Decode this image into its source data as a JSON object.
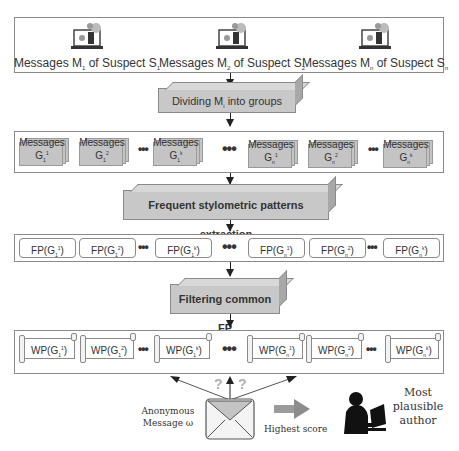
{
  "suspects": [
    {
      "prefix": "Messages M",
      "msub": "1",
      "mid": " of Suspect S",
      "ssub": "1"
    },
    {
      "prefix": "Messages M",
      "msub": "2",
      "mid": " of Suspect S",
      "ssub": "2"
    },
    {
      "prefix": "Messages M",
      "msub": "n",
      "mid": " of Suspect S",
      "ssub": "n"
    }
  ],
  "steps": {
    "divide": {
      "prefix": "Dividing M",
      "sub": "i",
      "suffix": " into groups"
    },
    "extract": "Frequent stylometric patterns extraction",
    "filter": "Filtering common FP"
  },
  "groups": [
    {
      "label": "Messages",
      "g": "G",
      "sub": "1",
      "sup": "1"
    },
    {
      "label": "Messages",
      "g": "G",
      "sub": "1",
      "sup": "2"
    },
    {
      "label": "Messages",
      "g": "G",
      "sub": "1",
      "sup": "k"
    },
    {
      "label": "Messages",
      "g": "G",
      "sub": "n",
      "sup": "1"
    },
    {
      "label": "Messages",
      "g": "G",
      "sub": "n",
      "sup": "2"
    },
    {
      "label": "Messages",
      "g": "G",
      "sub": "n",
      "sup": "k"
    }
  ],
  "fps": [
    {
      "pre": "FP(G",
      "sub": "1",
      "sup": "1",
      "post": ")"
    },
    {
      "pre": "FP(G",
      "sub": "1",
      "sup": "2",
      "post": ")"
    },
    {
      "pre": "FP(G",
      "sub": "1",
      "sup": "k",
      "post": ")"
    },
    {
      "pre": "FP(G",
      "sub": "n",
      "sup": "1",
      "post": ")"
    },
    {
      "pre": "FP(G",
      "sub": "n",
      "sup": "2",
      "post": ")"
    },
    {
      "pre": "FP(G",
      "sub": "n",
      "sup": "k",
      "post": ")"
    }
  ],
  "wps": [
    {
      "pre": "WP(G",
      "sub": "1",
      "sup": "1",
      "post": ")"
    },
    {
      "pre": "WP(G",
      "sub": "1",
      "sup": "2",
      "post": ")"
    },
    {
      "pre": "WP(G",
      "sub": "1",
      "sup": "k",
      "post": ")"
    },
    {
      "pre": "WP(G",
      "sub": "n",
      "sup": "1",
      "post": ")"
    },
    {
      "pre": "WP(G",
      "sub": "n",
      "sup": "2",
      "post": ")"
    },
    {
      "pre": "WP(G",
      "sub": "n",
      "sup": "k",
      "post": ")"
    }
  ],
  "ellipsis": "•••",
  "anonymous": {
    "line1": "Anonymous",
    "line2": "Message ω"
  },
  "question_marks": [
    "?",
    "?"
  ],
  "highest_score": "Highest score",
  "author": {
    "line1": "Most",
    "line2": "plausible",
    "line3": "author"
  },
  "colors": {
    "box_fill": "#c8c8c8",
    "border": "#8a8a8a",
    "arrow": "#222222",
    "score_arrow": "#8c8c8c",
    "question": "#b0b0b0"
  }
}
